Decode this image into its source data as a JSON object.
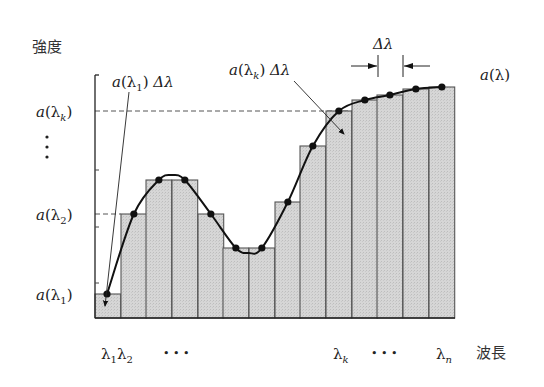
{
  "chart_data": {
    "type": "bar",
    "title": "",
    "ylabel": "強度",
    "xlabel": "波長",
    "bar_count": 14,
    "bar_left_px": [
      95,
      121,
      146,
      172,
      198,
      223,
      249,
      275,
      300,
      326,
      352,
      377,
      403,
      429
    ],
    "bar_width_px": 25.7,
    "bar_top_px": [
      294,
      214,
      180,
      180,
      214,
      248,
      248,
      202,
      146,
      111,
      100,
      95,
      89,
      87
    ],
    "baseline_px": 318,
    "curve": "smooth line through the top-center point of each bar",
    "x_tick_labels": [
      {
        "text": "λ1λ2",
        "base": "λ",
        "subs": [
          "1",
          "2"
        ]
      },
      {
        "text": "…"
      },
      {
        "text": "λk",
        "base": "λ",
        "sub": "k"
      },
      {
        "text": "…"
      },
      {
        "text": "λn",
        "base": "λ",
        "sub": "n"
      }
    ],
    "y_tick_labels": [
      "a(λk)",
      "⋮",
      "a(λ2)",
      "a(λ1)"
    ],
    "annotations": [
      "a(λ1)Δλ",
      "a(λk)Δλ",
      "Δλ",
      "a(λ)"
    ]
  },
  "labels": {
    "y_axis": "強度",
    "x_axis": "波長",
    "a": "a",
    "lambda": "λ",
    "delta": "Δλ",
    "sub1": "1",
    "sub2": "2",
    "subk": "k",
    "subn": "n",
    "dots_h": "• • •",
    "curve_label": "a(λ)"
  },
  "colors": {
    "bar_fill": "#d4d4d4",
    "bar_stroke": "#555555",
    "curve": "#111111",
    "dash": "#555555"
  }
}
